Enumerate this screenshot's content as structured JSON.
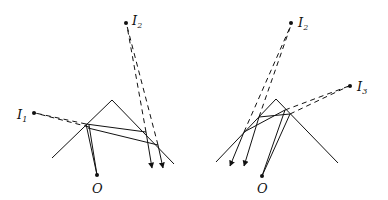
{
  "diagram": {
    "type": "ray-optics-two-mirror-reflection",
    "panels": [
      {
        "id": "left",
        "mirror_apex": [
          112,
          100
        ],
        "mirror_left_end": [
          52,
          158
        ],
        "mirror_right_end": [
          174,
          164
        ],
        "observer": {
          "label": "O",
          "pos": [
            97,
            175
          ]
        },
        "images": [
          {
            "label": "I",
            "sub": "1",
            "pos": [
              34,
              113
            ]
          },
          {
            "label": "I",
            "sub": "2",
            "pos": [
              126,
              23
            ]
          }
        ]
      },
      {
        "id": "right",
        "mirror_apex": [
          276,
          99
        ],
        "mirror_left_end": [
          216,
          162
        ],
        "mirror_right_end": [
          338,
          163
        ],
        "observer": {
          "label": "O",
          "pos": [
            262,
            176
          ]
        },
        "images": [
          {
            "label": "I",
            "sub": "2",
            "pos": [
              291,
              23
            ]
          },
          {
            "label": "I",
            "sub": "3",
            "pos": [
              350,
              86
            ]
          }
        ]
      }
    ],
    "labels": {
      "left_O": "O",
      "left_I1": "I",
      "left_I1_sub": "1",
      "left_I2": "I",
      "left_I2_sub": "2",
      "right_O": "O",
      "right_I2": "I",
      "right_I2_sub": "2",
      "right_I3": "I",
      "right_I3_sub": "3"
    },
    "colors": {
      "ink": "#111111",
      "background": "#ffffff"
    }
  }
}
